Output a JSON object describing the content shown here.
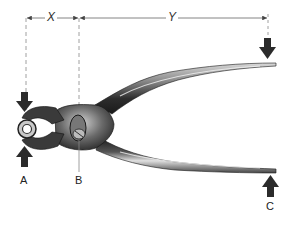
{
  "diagram": {
    "dimensions": {
      "x_label": "X",
      "y_label": "Y"
    },
    "points": {
      "a_label": "A",
      "b_label": "B",
      "c_label": "C"
    },
    "colors": {
      "arrow": "#2b2b2b",
      "dimension_line": "#777777",
      "metal_dark": "#2a2a2a",
      "metal_light": "#e6e6e6"
    }
  }
}
